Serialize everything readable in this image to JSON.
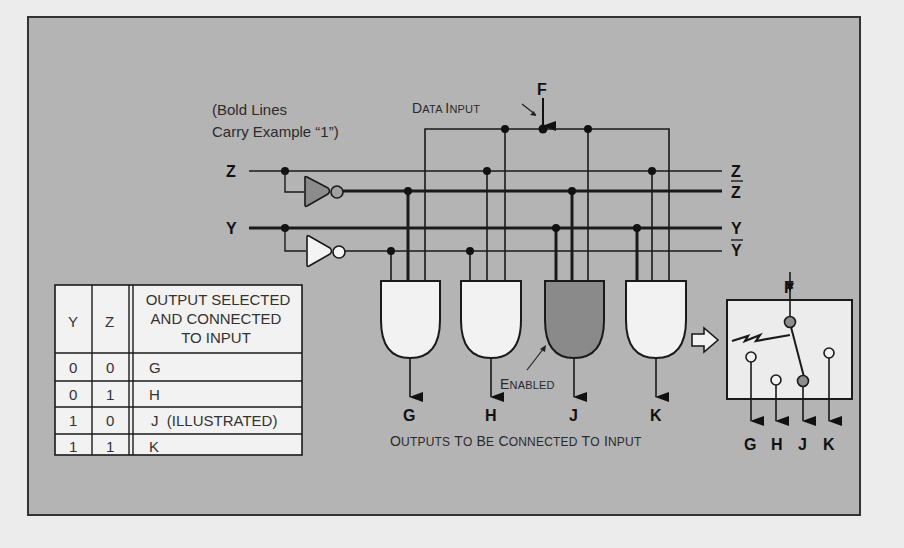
{
  "diagram": {
    "note": [
      "(Bold Lines",
      "Carry Example “1”)"
    ],
    "data_input": {
      "signal": "F",
      "label_big": [
        "D",
        "I"
      ],
      "label_small": [
        "ATA ",
        "NPUT"
      ]
    },
    "inputs": {
      "z": "Z",
      "y": "Y"
    },
    "bus_labels": {
      "z": "Z",
      "z_bar": "Z",
      "y": "Y",
      "y_bar": "Y"
    },
    "gates": [
      {
        "output": "G",
        "enabled": false
      },
      {
        "output": "H",
        "enabled": false
      },
      {
        "output": "J",
        "enabled": true
      },
      {
        "output": "K",
        "enabled": false
      }
    ],
    "enabled_label": {
      "big": "E",
      "small": "NABLED"
    },
    "outputs_caption": {
      "words": [
        {
          "big": "O",
          "small": "UTPUTS"
        },
        {
          "big": "T",
          "small": "O"
        },
        {
          "big": "B",
          "small": "E"
        },
        {
          "big": "C",
          "small": "ONNECTED"
        },
        {
          "big": "T",
          "small": "O"
        },
        {
          "big": "I",
          "small": "NPUT"
        }
      ]
    },
    "switch_equivalent": {
      "input": "F",
      "outputs": [
        "G",
        "H",
        "J",
        "K"
      ],
      "selected": "J"
    },
    "colors": {
      "panel": "#b4b4b4",
      "enabled_fill": "#8a8a8a",
      "gate_fill": "#f2f2f2",
      "line": "#1a1a1a"
    }
  },
  "truth_table": {
    "headers": [
      "Y",
      "Z",
      [
        "OUTPUT SELECTED",
        "AND CONNECTED",
        "TO INPUT"
      ]
    ],
    "rows": [
      [
        "0",
        "0",
        "G"
      ],
      [
        "0",
        "1",
        "H"
      ],
      [
        "1",
        "0",
        "J  (ILLUSTRATED)"
      ],
      [
        "1",
        "1",
        "K"
      ]
    ]
  }
}
